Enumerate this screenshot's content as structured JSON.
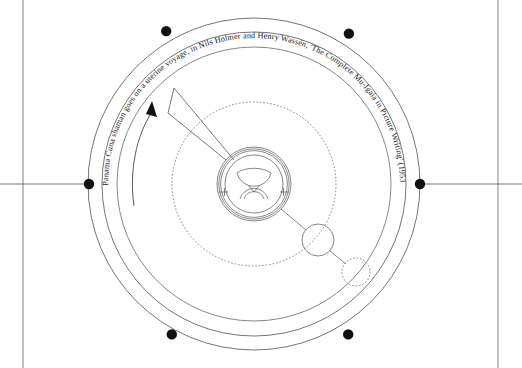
{
  "page": {
    "width": 522,
    "height": 368,
    "background_color": "#ffffff",
    "ink_color": "#222222",
    "node_color": "#111111"
  },
  "caption": {
    "full_text": "Panama Cuna shaman goes on a uterine voyage, in Nils Holmer and Henry Wassén, 'The Complete Mu-Igala in Picture Writing' (1953)",
    "subject": "Panama Cuna shaman goes on a uterine voyage",
    "source_authors": "Nils Holmer and Henry Wassén",
    "source_title": "'The Complete Mu-Igala in Picture Writing'",
    "source_year": "(1953)",
    "orientation": "arc-top",
    "placement": "along outer ring"
  },
  "diagram": {
    "center": {
      "x": 254,
      "y": 184
    },
    "rings": [
      {
        "name": "outer-ring",
        "radius": 166,
        "style": "solid"
      },
      {
        "name": "caption-ring",
        "radius": 152,
        "style": "solid"
      },
      {
        "name": "inner-ring",
        "radius": 137,
        "style": "solid"
      },
      {
        "name": "orbit-ring",
        "radius": 82,
        "style": "dotted"
      }
    ],
    "nodes": [
      {
        "name": "node-upper-left",
        "angle_deg": 247,
        "radius": 5.2
      },
      {
        "name": "node-upper-right",
        "angle_deg": 293,
        "radius": 5.2
      },
      {
        "name": "node-left",
        "angle_deg": 180,
        "radius": 5.2
      },
      {
        "name": "node-right",
        "angle_deg": 0,
        "radius": 5.2
      },
      {
        "name": "node-lower-left",
        "angle_deg": 115,
        "radius": 5.2
      },
      {
        "name": "node-lower-right",
        "angle_deg": 65,
        "radius": 5.2
      }
    ],
    "axis_lines": [
      {
        "name": "axis-left",
        "from_x": 0,
        "to_x": 89,
        "y": 184
      },
      {
        "name": "axis-right",
        "from_x": 420,
        "to_x": 522,
        "y": 184
      }
    ],
    "margin_rules": [
      {
        "name": "margin-rule-left",
        "x": 23
      },
      {
        "name": "margin-rule-right",
        "x": 498
      }
    ],
    "glyph": {
      "name": "womb-glyph",
      "outer_circle_radius": 36,
      "double_circle_radius": 34,
      "inner_circle_radius": 29,
      "crescent_label": "crescent-bowl",
      "arc_label": "lower-arc",
      "side_ticks": 2
    },
    "satellites": [
      {
        "name": "satellite-solid",
        "cx": 318,
        "cy": 240,
        "r": 16,
        "style": "solid"
      },
      {
        "name": "satellite-dotted",
        "cx": 356,
        "cy": 272,
        "r": 14,
        "style": "dotted"
      }
    ],
    "wedge": {
      "name": "voyage-wedge",
      "description": "pointed path from glyph to upper-left",
      "points": "226,160 168,113 174,88 232,159"
    },
    "arrow": {
      "name": "direction-arrow",
      "description": "counterclockwise travel arrow on caption ring",
      "head_x": 151,
      "head_y": 108
    }
  }
}
